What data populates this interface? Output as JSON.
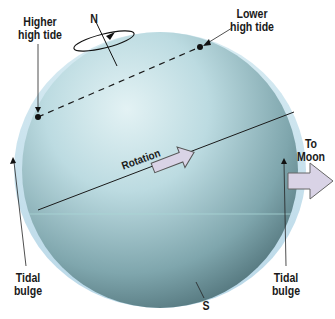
{
  "diagram": {
    "labels": {
      "north_pole": "N",
      "south_pole": "S",
      "higher_high_tide": "Higher\nhigh tide",
      "lower_high_tide": "Lower\nhigh tide",
      "rotation": "Rotation",
      "to_moon": "To\nMoon",
      "tidal_bulge_left": "Tidal\nbulge",
      "tidal_bulge_right": "Tidal\nbulge"
    },
    "icons": {
      "rotation_arrow": "right-arrow-outline",
      "moon_direction_arrow": "right-arrow-block",
      "spin_ellipse": "circular-rotation-arrow"
    },
    "colors": {
      "sphere_light": "#cfe7ec",
      "sphere_mid": "#8fb9c2",
      "sphere_dark": "#4f7279",
      "bulge": "#c6e0ee",
      "arrow_fill": "#d9d3e6",
      "arrow_stroke": "#555555",
      "line": "#1a1a1a"
    }
  }
}
